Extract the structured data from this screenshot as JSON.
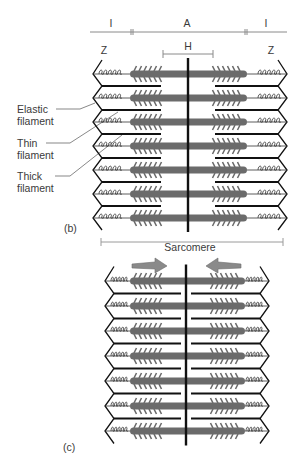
{
  "figure": {
    "top_bar": {
      "left_band": "I",
      "center_band": "A",
      "right_band": "I"
    },
    "h_zone": "H",
    "z_left": "Z",
    "z_right": "Z",
    "callouts": [
      {
        "line1": "Elastic",
        "line2": "filament"
      },
      {
        "line1": "Thin",
        "line2": "filament"
      },
      {
        "line1": "Thick",
        "line2": "filament"
      }
    ],
    "panel_b_label": "(b)",
    "sarcomere_label": "Sarcomere",
    "panel_c_label": "(c)",
    "colors": {
      "thick_filament": "#6b6b6b",
      "thin_filament": "#111111",
      "arrow": "#8a8a8a",
      "scale_line": "#9a9a9a"
    },
    "panel_b": {
      "rows": 7,
      "state": "relaxed"
    },
    "panel_c": {
      "rows": 7,
      "state": "contracted"
    }
  }
}
